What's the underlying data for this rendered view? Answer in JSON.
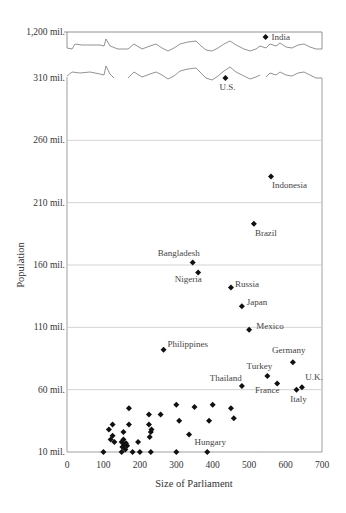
{
  "chart_data": {
    "type": "scatter",
    "title": "",
    "xlabel": "Size of Parliament",
    "ylabel": "Population",
    "xlim": [
      0,
      700
    ],
    "x_ticks": [
      0,
      100,
      200,
      300,
      400,
      500,
      600,
      700
    ],
    "y_ticks": [
      "10 mil.",
      "60 mil.",
      "110 mil.",
      "160 mil.",
      "210 mil.",
      "260 mil.",
      "310 mil.",
      "1,200 mil."
    ],
    "y_axis_break": "between 310 mil. and 1,200 mil.",
    "grid": "horizontal",
    "legend": "none",
    "points_labeled": [
      {
        "label": "India",
        "x": 545,
        "y": 1210
      },
      {
        "label": "U.S.",
        "x": 435,
        "y": 310
      },
      {
        "label": "Indonesia",
        "x": 560,
        "y": 231
      },
      {
        "label": "Brazil",
        "x": 513,
        "y": 193
      },
      {
        "label": "Bangladesh",
        "x": 345,
        "y": 162
      },
      {
        "label": "Nigeria",
        "x": 360,
        "y": 154
      },
      {
        "label": "Russia",
        "x": 450,
        "y": 142
      },
      {
        "label": "Japan",
        "x": 480,
        "y": 127
      },
      {
        "label": "Mexico",
        "x": 500,
        "y": 108
      },
      {
        "label": "Philippines",
        "x": 265,
        "y": 92
      },
      {
        "label": "Germany",
        "x": 620,
        "y": 82
      },
      {
        "label": "Turkey",
        "x": 550,
        "y": 71
      },
      {
        "label": "Thailand",
        "x": 480,
        "y": 63
      },
      {
        "label": "France",
        "x": 577,
        "y": 65
      },
      {
        "label": "U.K.",
        "x": 645,
        "y": 62
      },
      {
        "label": "Italy",
        "x": 630,
        "y": 60
      },
      {
        "label": "Hungary",
        "x": 385,
        "y": 10
      }
    ],
    "points_unlabeled": [
      {
        "x": 100,
        "y": 10
      },
      {
        "x": 115,
        "y": 28
      },
      {
        "x": 120,
        "y": 20
      },
      {
        "x": 125,
        "y": 32
      },
      {
        "x": 125,
        "y": 23
      },
      {
        "x": 130,
        "y": 18
      },
      {
        "x": 150,
        "y": 10
      },
      {
        "x": 150,
        "y": 18
      },
      {
        "x": 152,
        "y": 14
      },
      {
        "x": 155,
        "y": 20
      },
      {
        "x": 155,
        "y": 26
      },
      {
        "x": 158,
        "y": 16
      },
      {
        "x": 160,
        "y": 12
      },
      {
        "x": 162,
        "y": 17
      },
      {
        "x": 165,
        "y": 15
      },
      {
        "x": 170,
        "y": 45
      },
      {
        "x": 170,
        "y": 32
      },
      {
        "x": 180,
        "y": 10
      },
      {
        "x": 195,
        "y": 18
      },
      {
        "x": 200,
        "y": 10
      },
      {
        "x": 225,
        "y": 32
      },
      {
        "x": 225,
        "y": 40
      },
      {
        "x": 227,
        "y": 22
      },
      {
        "x": 230,
        "y": 10
      },
      {
        "x": 230,
        "y": 26
      },
      {
        "x": 232,
        "y": 28
      },
      {
        "x": 257,
        "y": 40
      },
      {
        "x": 300,
        "y": 10
      },
      {
        "x": 300,
        "y": 48
      },
      {
        "x": 308,
        "y": 35
      },
      {
        "x": 335,
        "y": 24
      },
      {
        "x": 350,
        "y": 46
      },
      {
        "x": 390,
        "y": 35
      },
      {
        "x": 400,
        "y": 48
      },
      {
        "x": 450,
        "y": 45
      },
      {
        "x": 458,
        "y": 37
      }
    ]
  },
  "labels": {
    "y_ticks": [
      "10 mil.",
      "60 mil.",
      "110 mil.",
      "160 mil.",
      "210 mil.",
      "260 mil.",
      "310 mil.",
      "1,200 mil."
    ],
    "x_ticks": [
      "0",
      "100",
      "200",
      "300",
      "400",
      "500",
      "600",
      "700"
    ],
    "xlabel": "Size of Parliament",
    "ylabel": "Population"
  }
}
